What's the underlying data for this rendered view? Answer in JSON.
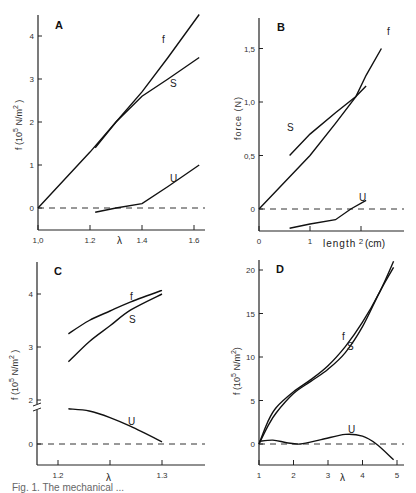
{
  "chart_data": [
    {
      "panel": "A",
      "type": "line",
      "xlabel": "λ",
      "ylabel": "f (10^5 N/m^2)",
      "xticks": [
        "1.0",
        "1.2",
        "1.4",
        "1.6"
      ],
      "yticks": [
        "0",
        "1",
        "2",
        "3",
        "4"
      ],
      "xlim": [
        1.0,
        1.62
      ],
      "ylim": [
        -0.5,
        4.5
      ],
      "reference_line": {
        "y": 0,
        "style": "dashed"
      },
      "series": [
        {
          "name": "f",
          "x": [
            1.0,
            1.2,
            1.3,
            1.4,
            1.5,
            1.62
          ],
          "y": [
            0,
            1.3,
            2.0,
            2.7,
            3.5,
            4.5
          ]
        },
        {
          "name": "S",
          "x": [
            1.22,
            1.3,
            1.4,
            1.5,
            1.62
          ],
          "y": [
            1.4,
            2.0,
            2.6,
            3.0,
            3.5
          ]
        },
        {
          "name": "U",
          "x": [
            1.22,
            1.3,
            1.4,
            1.5,
            1.62
          ],
          "y": [
            -0.1,
            0.0,
            0.1,
            0.5,
            1.0
          ]
        }
      ]
    },
    {
      "panel": "B",
      "type": "line",
      "xlabel": "length (cm)",
      "ylabel": "force (N)",
      "xticks": [
        "0",
        "1",
        "2"
      ],
      "yticks": [
        "0",
        "0.5",
        "1.0",
        "1.5"
      ],
      "xlim": [
        0,
        2.8
      ],
      "ylim": [
        -0.2,
        1.8
      ],
      "reference_line": {
        "y": 0,
        "style": "dashed"
      },
      "series": [
        {
          "name": "f",
          "x": [
            0,
            1.0,
            1.5,
            1.9,
            2.1,
            2.4
          ],
          "y": [
            0,
            0.5,
            0.8,
            1.05,
            1.25,
            1.5
          ]
        },
        {
          "name": "S",
          "x": [
            0.6,
            1.0,
            1.5,
            1.9,
            2.1
          ],
          "y": [
            0.5,
            0.7,
            0.9,
            1.05,
            1.15
          ]
        },
        {
          "name": "U",
          "x": [
            0.6,
            1.0,
            1.5,
            1.8,
            2.1
          ],
          "y": [
            -0.18,
            -0.14,
            -0.1,
            0.0,
            0.08
          ]
        }
      ]
    },
    {
      "panel": "C",
      "type": "line",
      "xlabel": "λ",
      "ylabel": "f (10^5 N/m^2)",
      "xticks": [
        "1.2",
        "1.3"
      ],
      "yticks": [
        "0",
        "2",
        "3",
        "4"
      ],
      "axis_break": true,
      "xlim": [
        1.18,
        1.34
      ],
      "reference_line": {
        "y": 0,
        "style": "dashed"
      },
      "series": [
        {
          "name": "f",
          "x": [
            1.21,
            1.23,
            1.25,
            1.27,
            1.3
          ],
          "y": [
            3.25,
            3.5,
            3.68,
            3.85,
            4.07
          ]
        },
        {
          "name": "S",
          "x": [
            1.21,
            1.23,
            1.25,
            1.27,
            1.3
          ],
          "y": [
            2.72,
            3.1,
            3.4,
            3.7,
            4.0
          ]
        },
        {
          "name": "U",
          "x": [
            1.21,
            1.23,
            1.25,
            1.27,
            1.3
          ],
          "y": [
            1.6,
            1.5,
            1.2,
            0.8,
            0.1
          ]
        }
      ]
    },
    {
      "panel": "D",
      "type": "line",
      "xlabel": "λ",
      "ylabel": "f (10^5 N/m^2)",
      "xticks": [
        "1",
        "2",
        "3",
        "4",
        "5"
      ],
      "yticks": [
        "0",
        "5",
        "10",
        "15",
        "20"
      ],
      "xlim": [
        1,
        5.2
      ],
      "ylim": [
        -2,
        21
      ],
      "reference_line": {
        "y": 0,
        "style": "dashed"
      },
      "series": [
        {
          "name": "f",
          "x": [
            1,
            1.25,
            1.5,
            2,
            2.5,
            3,
            3.5,
            4,
            4.5,
            4.9
          ],
          "y": [
            0,
            2.5,
            4.2,
            6.0,
            7.4,
            9.0,
            11.2,
            14.0,
            17.5,
            21
          ]
        },
        {
          "name": "S",
          "x": [
            1,
            1.25,
            1.5,
            2,
            2.5,
            3,
            3.5,
            4,
            4.5,
            4.9
          ],
          "y": [
            0,
            2.0,
            3.6,
            5.8,
            7.2,
            8.6,
            10.5,
            13.5,
            17.5,
            20.3
          ]
        },
        {
          "name": "U",
          "x": [
            1,
            1.4,
            1.8,
            2.2,
            2.8,
            3.5,
            4.0,
            4.4,
            4.9
          ],
          "y": [
            0.3,
            0.45,
            0.15,
            0.0,
            0.5,
            1.1,
            0.9,
            0.0,
            -1.8
          ]
        }
      ]
    }
  ],
  "panels": {
    "A": {
      "label": "A",
      "ylabel": "f  (10",
      "ylabel_exp": "5",
      "ylabel_tail": " N/m",
      "ylabel_sq": "2",
      "ylabel_close": " )",
      "xlabel": "λ"
    },
    "B": {
      "label": "B",
      "ylabel": "force  (N)",
      "xlabel": "length",
      "xunit": "(cm)"
    },
    "C": {
      "label": "C",
      "ylabel": "f (10",
      "ylabel_exp": "5",
      "ylabel_tail": " N/m",
      "ylabel_sq": "2",
      "ylabel_close": " )",
      "xlabel": "λ"
    },
    "D": {
      "label": "D",
      "ylabel": "f  (10",
      "ylabel_exp": "5",
      "ylabel_tail": " N/m",
      "ylabel_sq": "2",
      "ylabel_close": ")",
      "xlabel": "λ"
    }
  },
  "caption": "Fig. 1.  The mechanical ..."
}
